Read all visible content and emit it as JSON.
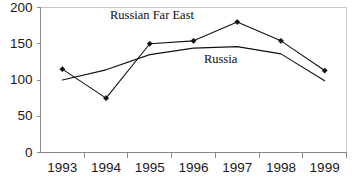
{
  "chart_data": {
    "type": "line",
    "title": "",
    "xlabel": "",
    "ylabel": "",
    "categories": [
      "1993",
      "1994",
      "1995",
      "1996",
      "1997",
      "1998",
      "1999"
    ],
    "ylim": [
      0,
      200
    ],
    "yticks": [
      0,
      50,
      100,
      150,
      200
    ],
    "grid": false,
    "legend": "inline-labels",
    "series": [
      {
        "name": "Russian Far East",
        "values": [
          115,
          75,
          150,
          154,
          180,
          154,
          113
        ],
        "marker": "diamond",
        "color": "#111111"
      },
      {
        "name": "Russia",
        "values": [
          100,
          114,
          135,
          144,
          146,
          136,
          99
        ],
        "marker": "none",
        "color": "#111111"
      }
    ],
    "annotations": [
      {
        "text": "Russian Far East",
        "x_value": 2.05,
        "y_value": 188
      },
      {
        "text": "Russia",
        "x_value": 3.62,
        "y_value": 128
      }
    ]
  },
  "axes": {
    "y_tick_labels": [
      "200",
      "150",
      "100",
      "50",
      "0"
    ],
    "x_tick_labels": [
      "1993",
      "1994",
      "1995",
      "1996",
      "1997",
      "1998",
      "1999"
    ]
  },
  "caption": {
    "text": ""
  }
}
